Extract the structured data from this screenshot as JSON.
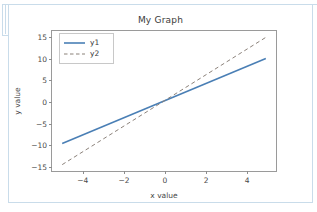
{
  "document": {
    "frame_color": "#c9dcea",
    "background": "#ffffff"
  },
  "chart_data": {
    "type": "line",
    "title": "My Graph",
    "xlabel": "x value",
    "ylabel": "y value",
    "xlim": [
      -5.5,
      5.5
    ],
    "ylim": [
      -16.5,
      16.5
    ],
    "grid": false,
    "legend_position": "upper left",
    "xticks": [
      -4,
      -2,
      0,
      2,
      4
    ],
    "xticklabels": [
      "−4",
      "−2",
      "0",
      "2",
      "4"
    ],
    "yticks": [
      15,
      10,
      5,
      0,
      -5,
      -10,
      -15
    ],
    "yticklabels": [
      "15",
      "10",
      "5",
      "0",
      "−5",
      "−10",
      "−15"
    ],
    "x": [
      -5,
      5
    ],
    "series": [
      {
        "name": "y1",
        "values": [
          -10,
          10
        ],
        "slope": 2,
        "intercept": 0,
        "color": "#4a7fb5",
        "linestyle": "solid",
        "linewidth": 1.6
      },
      {
        "name": "y2",
        "values": [
          -15,
          15
        ],
        "slope": 3,
        "intercept": 0,
        "color": "#8a8178",
        "linestyle": "dashed",
        "linewidth": 1.0
      }
    ]
  },
  "legend": {
    "entries": [
      {
        "label": "y1"
      },
      {
        "label": "y2"
      }
    ]
  }
}
